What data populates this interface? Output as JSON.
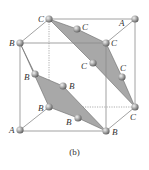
{
  "figure": {
    "caption": "(b)",
    "colors": {
      "background": "#ffffff",
      "edge": "#8a8a8a",
      "plane_fill": "#a8a8a8",
      "plane_stroke": "#6a6a6a",
      "atom_light": "#d8d8d8",
      "atom_dark": "#6e6e6e",
      "label": "#333333"
    },
    "cube": {
      "front": {
        "x1": 20,
        "y1": 43,
        "x2": 106,
        "y2": 131
      },
      "back": {
        "x1": 49,
        "y1": 19,
        "x2": 135,
        "y2": 107
      }
    },
    "atoms": [
      {
        "id": "c-top-back-left",
        "x": 49,
        "y": 19,
        "label": "C",
        "lx": 38,
        "ly": 22
      },
      {
        "id": "a-top-back-right",
        "x": 135,
        "y": 19,
        "label": "A",
        "lx": 119,
        "ly": 27
      },
      {
        "id": "c-upper-mid",
        "x": 77,
        "y": 29,
        "label": "C",
        "lx": 83,
        "ly": 30
      },
      {
        "id": "b-front-top-left",
        "x": 20,
        "y": 43,
        "label": "B",
        "lx": 9,
        "ly": 46
      },
      {
        "id": "c-front-top-right",
        "x": 106,
        "y": 43,
        "label": "C",
        "lx": 111,
        "ly": 46
      },
      {
        "id": "c-center-right",
        "x": 93,
        "y": 63,
        "label": "C",
        "lx": 81,
        "ly": 69
      },
      {
        "id": "b-left-mid",
        "x": 35,
        "y": 74,
        "label": "B",
        "lx": 24,
        "ly": 80
      },
      {
        "id": "c-right-mid",
        "x": 122,
        "y": 77,
        "label": "C",
        "lx": 120,
        "ly": 71
      },
      {
        "id": "b-center",
        "x": 63,
        "y": 86,
        "label": "B",
        "lx": 69,
        "ly": 89
      },
      {
        "id": "b-back-bottom-left",
        "x": 49,
        "y": 107,
        "label": "B",
        "lx": 38,
        "ly": 111
      },
      {
        "id": "c-back-bottom-right",
        "x": 135,
        "y": 107,
        "label": "C",
        "lx": 129,
        "ly": 120
      },
      {
        "id": "b-lower-mid",
        "x": 78,
        "y": 118,
        "label": "B",
        "lx": 66,
        "ly": 125
      },
      {
        "id": "a-front-bottom-left",
        "x": 20,
        "y": 130,
        "label": "A",
        "lx": 9,
        "ly": 133
      },
      {
        "id": "b-front-bottom-right",
        "x": 106,
        "y": 131,
        "label": "B",
        "lx": 112,
        "ly": 135
      }
    ],
    "planes": [
      {
        "id": "plane-b",
        "points": "20,43 49,107 106,131 35,74"
      },
      {
        "id": "plane-c",
        "points": "49,19 106,43 135,107 122,77"
      }
    ]
  }
}
